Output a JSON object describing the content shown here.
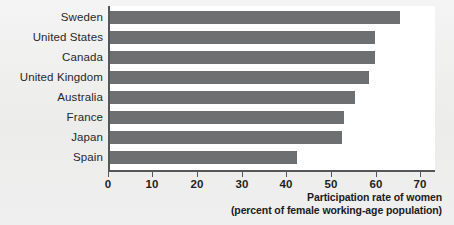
{
  "chart_data": {
    "type": "bar",
    "orientation": "horizontal",
    "title": "",
    "xlabel": "Participation rate of women",
    "xlabel_sub": "(percent of female working-age population)",
    "ylabel": "",
    "categories": [
      "Sweden",
      "United States",
      "Canada",
      "United Kingdom",
      "Australia",
      "France",
      "Japan",
      "Spain"
    ],
    "values": [
      65,
      59.5,
      59.5,
      58,
      55,
      52.5,
      52,
      42
    ],
    "xlim": [
      0,
      72
    ],
    "xticks": [
      0,
      10,
      20,
      30,
      40,
      50,
      60,
      70
    ],
    "xtick_labels": [
      "0",
      "10",
      "20",
      "30",
      "40",
      "50",
      "60",
      "70"
    ],
    "grid": false,
    "legend": false,
    "bar_color": "#6e6f71",
    "axis_color": "#55565a",
    "plot_background": "#ffffff",
    "page_background": "#efeeee"
  },
  "axis": {
    "caption_line1": "Participation rate of women",
    "caption_line2": "(percent of female working-age population)"
  }
}
